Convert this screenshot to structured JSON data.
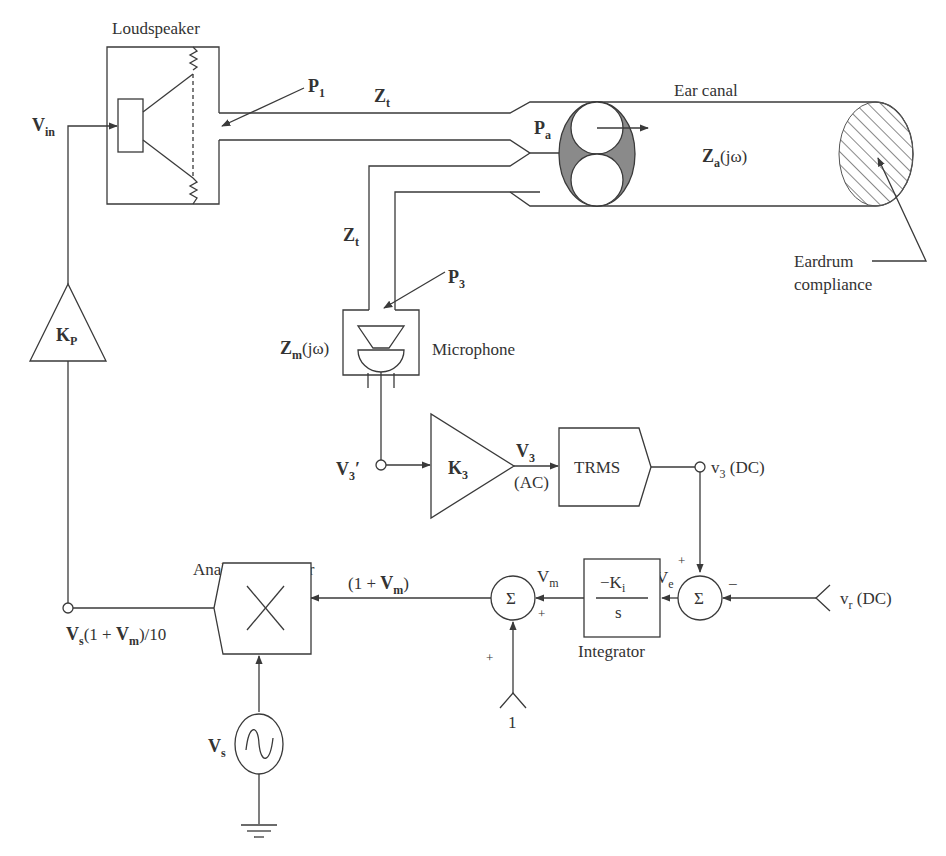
{
  "components": {
    "loudspeaker": {
      "label": "Loudspeaker"
    },
    "ear_canal": {
      "label": "Ear canal",
      "impedance": "Z",
      "impedance_sub": "a",
      "impedance_arg": "(jω)"
    },
    "eardrum": {
      "label_line1": "Eardrum",
      "label_line2": "compliance"
    },
    "microphone": {
      "label": "Microphone",
      "impedance": "Z",
      "impedance_sub": "m",
      "impedance_arg": "(jω)"
    },
    "tube_top": {
      "label": "Z",
      "sub": "t"
    },
    "tube_side": {
      "label": "Z",
      "sub": "t"
    },
    "p1": {
      "label": "P",
      "sub": "1"
    },
    "pa": {
      "label": "P",
      "sub": "a"
    },
    "p3": {
      "label": "P",
      "sub": "3"
    },
    "kp_amp": {
      "label": "K",
      "sub": "P"
    },
    "k3_amp": {
      "label": "K",
      "sub": "3"
    },
    "trms": {
      "label": "TRMS"
    },
    "integrator": {
      "label": "Integrator",
      "num": "−K",
      "num_sub": "i",
      "den": "s"
    },
    "summer1": {
      "label": "Σ"
    },
    "summer2": {
      "label": "Σ"
    },
    "multiplier": {
      "label": "Analog multiplier"
    },
    "source": {
      "label": "V",
      "sub": "s"
    }
  },
  "signals": {
    "vin": {
      "label": "V",
      "sub": "in"
    },
    "v3prime": {
      "label": "V",
      "sub": "3",
      "suffix": "′"
    },
    "v3_ac": {
      "label": "V",
      "sub": "3",
      "note": "(AC)"
    },
    "v3_dc": {
      "label": "v",
      "sub": "3",
      "note": " (DC)"
    },
    "vr_dc": {
      "label": "v",
      "sub": "r",
      "note": " (DC)"
    },
    "ve": {
      "label": "V",
      "sub": "e"
    },
    "vm": {
      "label": "V",
      "sub": "m"
    },
    "one_plus_vm": {
      "pre": "(1 + ",
      "label": "V",
      "sub": "m",
      "post": ")"
    },
    "vs_out": {
      "label": "V",
      "sub": "s",
      "mid": "(1 + ",
      "label2": "V",
      "sub2": "m",
      "post": ")/10"
    },
    "const_one": {
      "label": "1"
    }
  },
  "signs": {
    "sum2_top": "+",
    "sum2_right": "−",
    "sum1_right": "+",
    "sum1_bottom": "+"
  }
}
